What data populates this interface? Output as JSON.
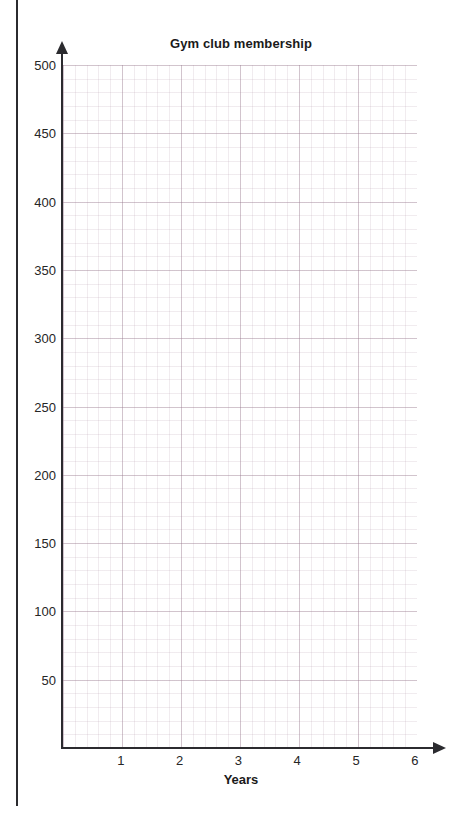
{
  "chart_data": {
    "type": "line",
    "title": "Gym club membership",
    "xlabel": "Years",
    "ylabel": "",
    "xlim": [
      0,
      6.2
    ],
    "ylim": [
      0,
      500
    ],
    "xticks": [
      "1",
      "2",
      "3",
      "4",
      "5",
      "6"
    ],
    "yticks": [
      "50",
      "100",
      "150",
      "200",
      "250",
      "300",
      "350",
      "400",
      "450",
      "500"
    ],
    "grid": "on",
    "grid_color": "#e8dce4",
    "legend": "none",
    "series": [],
    "values": [],
    "categories": [],
    "note": "Empty grid — no data plotted"
  },
  "axes": {
    "x_axis_name": "x-axis",
    "y_axis_name": "y-axis",
    "x_arrow": "arrow-right",
    "y_arrow": "arrow-up"
  },
  "page": {
    "background": "#ffffff",
    "rule_color": "#2b2b2f",
    "axis_color": "#2b2b2f",
    "text_color": "#262626"
  }
}
